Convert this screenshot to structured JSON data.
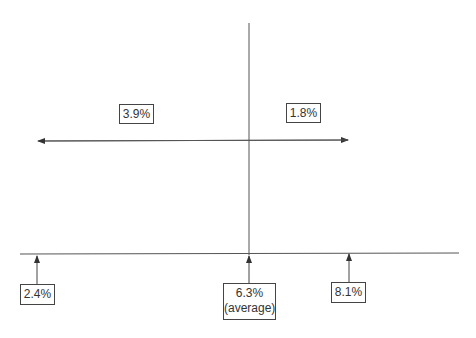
{
  "diagram": {
    "type": "growth-rate-range",
    "top_labels": {
      "left_spread": "3.9%",
      "right_spread": "1.8%"
    },
    "bottom_labels": {
      "low": "2.4%",
      "average": "6.3%",
      "average_note": "(average)",
      "high": "8.1%"
    },
    "colors": {
      "line": "#333333",
      "box_border": "#444444",
      "text": "#333333"
    }
  }
}
